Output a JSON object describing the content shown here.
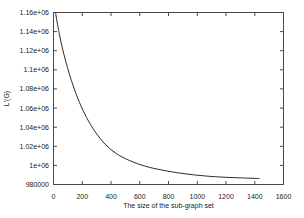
{
  "figure": {
    "background": "#ffffff"
  },
  "chart_data": {
    "type": "line",
    "title": "",
    "xlabel": "The size of the sub-graph set",
    "ylabel": "L'(G)",
    "xlim": [
      0,
      1600
    ],
    "ylim": [
      980000,
      1160000
    ],
    "x_ticks": [
      0,
      200,
      400,
      600,
      800,
      1000,
      1200,
      1400,
      1600
    ],
    "x_tick_labels": [
      "0",
      "200",
      "400",
      "600",
      "800",
      "1000",
      "1200",
      "1400",
      "1600"
    ],
    "y_ticks": [
      980000,
      1000000,
      1020000,
      1040000,
      1060000,
      1080000,
      1100000,
      1120000,
      1140000,
      1160000
    ],
    "y_tick_labels": [
      "980000",
      "1e+06",
      "1.02e+06",
      "1.04e+06",
      "1.06e+06",
      "1.08e+06",
      "1.1e+06",
      "1.12e+06",
      "1.14e+06",
      "1.16e+06"
    ],
    "grid": false,
    "legend": "none",
    "frame": "box-with-mirrored-inward-ticks",
    "colors": {
      "frame": "#4a4a4a",
      "curve": "#2b2b2b",
      "text": "#1a1a1a"
    },
    "series": [
      {
        "name": "L'(G)",
        "points": [
          [
            15,
            1159000
          ],
          [
            25,
            1150000
          ],
          [
            40,
            1138000
          ],
          [
            60,
            1124000
          ],
          [
            85,
            1109000
          ],
          [
            110,
            1096000
          ],
          [
            140,
            1082000
          ],
          [
            180,
            1066000
          ],
          [
            230,
            1050000
          ],
          [
            290,
            1035000
          ],
          [
            360,
            1022000
          ],
          [
            440,
            1012000
          ],
          [
            530,
            1005000
          ],
          [
            640,
            999000
          ],
          [
            760,
            995000
          ],
          [
            900,
            991500
          ],
          [
            1050,
            989000
          ],
          [
            1200,
            987500
          ],
          [
            1330,
            986800
          ],
          [
            1430,
            986300
          ]
        ]
      }
    ]
  }
}
